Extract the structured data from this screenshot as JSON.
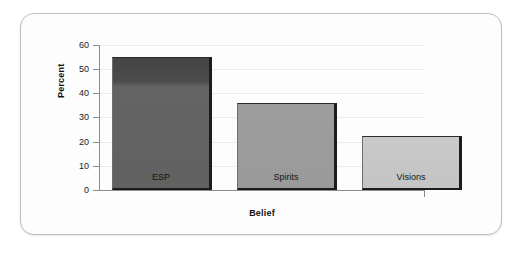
{
  "chart_data": {
    "type": "bar",
    "title": "",
    "subtitle": "",
    "xlabel": "Belief",
    "ylabel": "Percent",
    "categories": [
      "ESP",
      "Spirits",
      "Visions"
    ],
    "values": [
      55,
      36,
      22.5
    ],
    "series": [
      {
        "name": "Percent",
        "values": [
          55,
          36,
          22.5
        ]
      }
    ],
    "ylim": [
      0,
      60
    ],
    "yticks": [
      0,
      10,
      20,
      30,
      40,
      50,
      60
    ],
    "ytick_labels": [
      "0",
      "10",
      "20",
      "30",
      "40",
      "50",
      "60"
    ],
    "grid": true,
    "grid_axis": "y",
    "legend": false,
    "legend_position": "none",
    "bar_labels_inside": true,
    "bar_colors": [
      "#5d5d5d",
      "#9a9a9a",
      "#c6c6c6"
    ],
    "annotations": []
  },
  "figure": {
    "frame_color": "#bfbfbf",
    "background_color": "#fdfdfd",
    "axis_color": "#8c8c8c",
    "gridline_color": "#ececec",
    "text_color": "#111111"
  }
}
